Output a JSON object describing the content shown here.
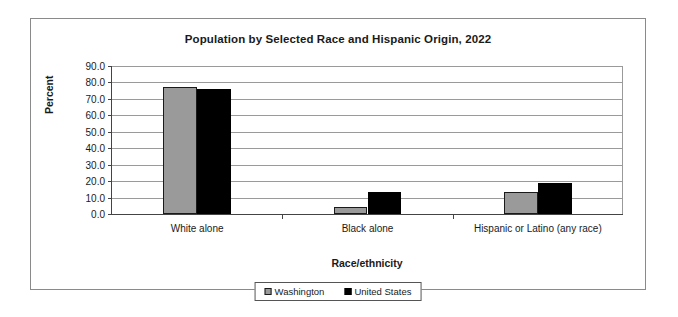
{
  "chart_data": {
    "type": "bar",
    "title": "Population by Selected Race and Hispanic Origin, 2022",
    "xlabel": "Race/ethnicity",
    "ylabel": "Percent",
    "categories": [
      "White alone",
      "Black alone",
      "Hispanic or Latino (any race)"
    ],
    "series": [
      {
        "name": "Washington",
        "color": "#9a9a9a",
        "values": [
          77.3,
          4.4,
          13.3
        ]
      },
      {
        "name": "United States",
        "color": "#000000",
        "values": [
          75.8,
          13.3,
          19.1
        ]
      }
    ],
    "ylim": [
      0.0,
      90.0
    ],
    "ytick_step": 10.0,
    "ytick_labels": [
      "90.0",
      "80.0",
      "70.0",
      "60.0",
      "50.0",
      "40.0",
      "30.0",
      "20.0",
      "10.0",
      "0.0"
    ],
    "ytick_values": [
      90.0,
      80.0,
      70.0,
      60.0,
      50.0,
      40.0,
      30.0,
      20.0,
      10.0,
      0.0
    ],
    "grid": true,
    "legend_position": "bottom-center"
  }
}
